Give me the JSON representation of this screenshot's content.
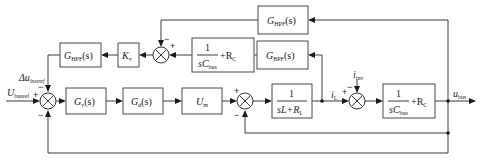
{
  "diagram": {
    "type": "control-block-diagram",
    "blocks": {
      "ghpf_top": {
        "main": "G",
        "sub": "HPF",
        "arg": "(s)"
      },
      "gbpf": {
        "main": "G",
        "sub": "BPF",
        "arg": "(s)"
      },
      "cbus_upper": {
        "num": "1",
        "den_main": "sC",
        "den_sub": "bus",
        "tail": "+R",
        "tail_sub": "C"
      },
      "kv": {
        "main": "K",
        "sub": "v"
      },
      "ghpf_left": {
        "main": "G",
        "sub": "HPF",
        "arg": "(s)"
      },
      "gv": {
        "main": "G",
        "sub": "v",
        "arg": "(s)"
      },
      "gd": {
        "main": "G",
        "sub": "d",
        "arg": "(s)"
      },
      "um": {
        "main": "U",
        "sub": "m"
      },
      "inductor": {
        "num": "1",
        "den": "sL+R",
        "den_sub": "L"
      },
      "cbus_right": {
        "num": "1",
        "den_main": "sC",
        "den_sub": "bus",
        "tail": "+R",
        "tail_sub": "C"
      }
    },
    "signals": {
      "delta_u": {
        "prefix": "Δu",
        "sub": "busref"
      },
      "u_ref": {
        "main": "U",
        "sub": "busref"
      },
      "i_inv": {
        "main": "i",
        "sub": "inv"
      },
      "i_l": {
        "main": "i",
        "sub": "L"
      },
      "u_bus": {
        "main": "u",
        "sub": "bus"
      }
    },
    "signs": {
      "plus": "+",
      "minus": "−"
    }
  }
}
